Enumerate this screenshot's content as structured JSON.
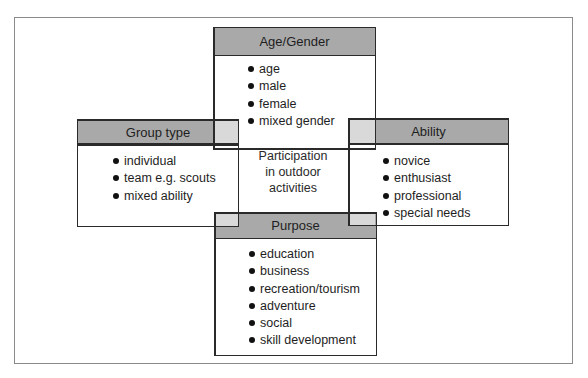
{
  "diagram": {
    "center_label": [
      "Participation",
      "in outdoor",
      "activities"
    ],
    "boxes": {
      "top": {
        "title": "Age/Gender",
        "items": [
          "age",
          "male",
          "female",
          "mixed gender"
        ]
      },
      "left": {
        "title": "Group type",
        "items": [
          "individual",
          "team e.g. scouts",
          "mixed ability"
        ]
      },
      "right": {
        "title": "Ability",
        "items": [
          "novice",
          "enthusiast",
          "professional",
          "special needs"
        ]
      },
      "bottom": {
        "title": "Purpose",
        "items": [
          "education",
          "business",
          "recreation/tourism",
          "adventure",
          "social",
          "skill development"
        ]
      }
    },
    "colors": {
      "header_fill": "#a9a9a9",
      "overlap_fill": "#d9d9d9",
      "border": "#2a2a2a"
    }
  }
}
